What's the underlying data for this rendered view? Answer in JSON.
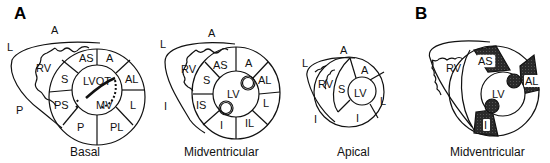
{
  "panels": {
    "a": "A",
    "b": "B"
  },
  "basal": {
    "caption": "Basal",
    "orient": {
      "a": "A",
      "l": "L",
      "p": "P"
    },
    "segments": {
      "as": "AS",
      "a": "A",
      "al": "AL",
      "l": "L",
      "pl": "PL",
      "p": "P",
      "ps": "PS",
      "s": "S"
    },
    "rv": "RV",
    "lvot": "LVOT",
    "mv": "MV"
  },
  "mid": {
    "caption": "Midventricular",
    "orient": {
      "a": "A",
      "l": "L",
      "i": "I"
    },
    "segments": {
      "as": "AS",
      "a": "A",
      "al": "AL",
      "l": "L",
      "il": "IL",
      "i": "I",
      "is": "IS",
      "s": "S"
    },
    "rv": "RV",
    "lv": "LV"
  },
  "apical": {
    "caption": "Apical",
    "orient": {
      "a": "A",
      "l": "L",
      "i": "I"
    },
    "segments": {
      "a": "A",
      "l": "L",
      "i": "I",
      "s": "S"
    },
    "rv": "RV",
    "lv": "LV"
  },
  "b_mid": {
    "caption": "Midventricular",
    "highlighted": {
      "as": "AS",
      "al": "AL",
      "i": "I"
    },
    "rv": "RV",
    "lv": "LV"
  },
  "colors": {
    "line": "#111111",
    "fill_dark": "#2a2a2a",
    "background": "#ffffff"
  }
}
